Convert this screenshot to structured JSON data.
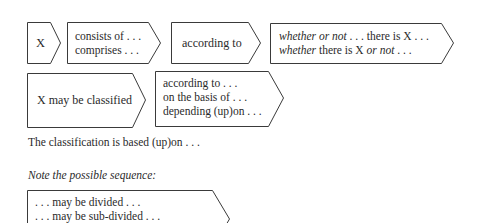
{
  "row1": {
    "box_x": {
      "label": "X"
    },
    "box_consists": {
      "lines": [
        "consists of . . .",
        "comprises . . ."
      ]
    },
    "box_according": {
      "label": "according to"
    },
    "box_whether": {
      "line1": {
        "a": "whether or not",
        "b": " . . . there is X . . ."
      },
      "line2": {
        "a": "whether",
        "b": " there is X ",
        "c": "or not",
        "d": " . . ."
      }
    }
  },
  "row2": {
    "box_classified": {
      "label": "X may be classified"
    },
    "box_basis": {
      "lines": [
        "according to . . .",
        "on the basis of . . .",
        "depending (up)on . . ."
      ]
    }
  },
  "classification_sentence": "The classification is based (up)on . . .",
  "note": "Note the possible sequence:",
  "sequence_box": {
    "lines": [
      ". . . may be divided . . .",
      ". . . may be sub-divided . . ."
    ]
  }
}
